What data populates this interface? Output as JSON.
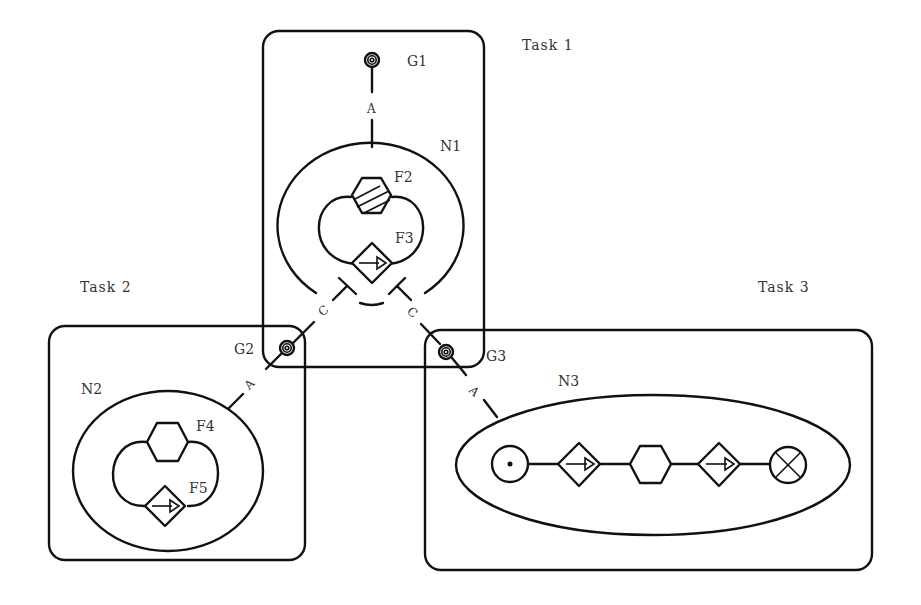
{
  "diagram": {
    "tasks": [
      {
        "id": "task1",
        "label": "Task  1",
        "goal": "G1",
        "net": "N1",
        "functions": [
          "F2",
          "F3"
        ]
      },
      {
        "id": "task2",
        "label": "Task  2",
        "goal": "G2",
        "net": "N2",
        "functions": [
          "F4",
          "F5"
        ]
      },
      {
        "id": "task3",
        "label": "Task  3",
        "goal": "G3",
        "net": "N3",
        "functions": []
      }
    ],
    "labels": {
      "task1": "Task  1",
      "task2": "Task  2",
      "task3": "Task  3",
      "g1": "G1",
      "g2": "G2",
      "g3": "G3",
      "n1": "N1",
      "n2": "N2",
      "n3": "N3",
      "f2": "F2",
      "f3": "F3",
      "f4": "F4",
      "f5": "F5",
      "arc_a1": "A",
      "arc_a2": "A",
      "arc_a3": "A",
      "arc_c1": "C",
      "arc_c2": "C"
    },
    "n3_sequence": [
      "start-circle",
      "arrow-diamond",
      "hexagon",
      "arrow-diamond",
      "end-cross-circle"
    ],
    "colors": {
      "line": "#111111",
      "text": "#333333",
      "background": "#ffffff"
    }
  }
}
